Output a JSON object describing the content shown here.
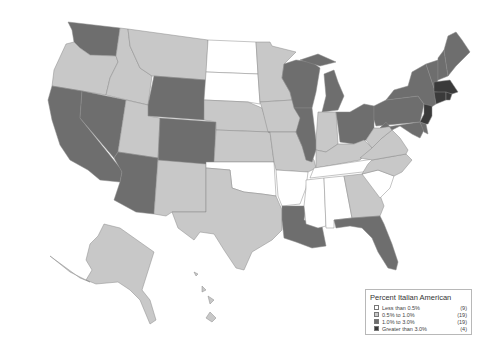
{
  "title": "Percent Italian American",
  "colors": {
    "lt_0_5": "#ffffff",
    "0_5_to_1": "#c8c8c8",
    "1_to_3": "#6e6e6e",
    "gt_3": "#3a3a3a",
    "border": "#8a8a8a"
  },
  "legend": {
    "title": "Percent Italian American",
    "items": [
      {
        "label": "Less than 0.5%",
        "count": "(9)",
        "color": "#ffffff"
      },
      {
        "label": "0.5% to 1.0%",
        "count": "(19)",
        "color": "#c8c8c8"
      },
      {
        "label": "1.0% to 3.0%",
        "count": "(19)",
        "color": "#6e6e6e"
      },
      {
        "label": "Greater than 3.0%",
        "count": "(4)",
        "color": "#3a3a3a"
      }
    ]
  },
  "states": {
    "less_than_0_5": [
      "ND",
      "SD",
      "OK",
      "AR",
      "MS",
      "AL",
      "TN",
      "SC",
      "KY-strip"
    ],
    "0_5_to_1_0": [
      "OR",
      "ID",
      "MT",
      "UT",
      "NM",
      "TX",
      "NE",
      "KS",
      "MN",
      "IA",
      "MO",
      "IN",
      "KY",
      "WV",
      "VA",
      "NC",
      "GA",
      "AK",
      "HI"
    ],
    "1_0_to_3_0": [
      "WA",
      "CA",
      "NV",
      "AZ",
      "WY",
      "CO",
      "WI",
      "IL",
      "MI",
      "OH",
      "PA",
      "NY",
      "VT",
      "NH",
      "ME",
      "MD",
      "DE",
      "LA",
      "FL"
    ],
    "greater_than_3_0": [
      "MA",
      "CT",
      "RI",
      "NJ"
    ]
  }
}
